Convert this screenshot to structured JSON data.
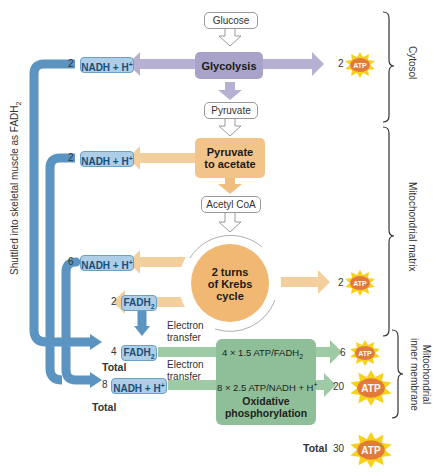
{
  "diagram": {
    "molecules": {
      "glucose": "Glucose",
      "pyruvate": "Pyruvate",
      "acetyl_coa": "Acetyl CoA"
    },
    "processes": {
      "glycolysis": "Glycolysis",
      "pyruvate_to_acetate_1": "Pyruvate",
      "pyruvate_to_acetate_2": "to acetate",
      "krebs_1": "2 turns",
      "krebs_2": "of Krebs",
      "krebs_3": "cycle",
      "oxphos_1": "Oxidative",
      "oxphos_2": "phosphorylation",
      "oxphos_line1": "4 × 1.5 ATP/FADH",
      "oxphos_line1_sub": "2",
      "oxphos_line2": "8 × 2.5 ATP/NADH + H",
      "oxphos_line2_sup": "+"
    },
    "carriers": [
      {
        "count": "2",
        "label": "NADH + H",
        "sup": "+",
        "source": "glycolysis"
      },
      {
        "count": "2",
        "label": "NADH + H",
        "sup": "+",
        "source": "pyruvate to acetate"
      },
      {
        "count": "6",
        "label": "NADH + H",
        "sup": "+",
        "source": "krebs"
      },
      {
        "count": "2",
        "label": "FADH",
        "sub": "2",
        "source": "krebs"
      },
      {
        "count": "4",
        "label": "FADH",
        "sub": "2",
        "source": "total"
      },
      {
        "count": "8",
        "label": "NADH + H",
        "sup": "+",
        "source": "total"
      }
    ],
    "atp_yields": [
      {
        "count": "2",
        "label": "ATP",
        "source": "glycolysis"
      },
      {
        "count": "2",
        "label": "ATP",
        "source": "krebs"
      },
      {
        "count": "6",
        "label": "ATP",
        "source": "FADH2 oxidation"
      },
      {
        "count": "20",
        "label": "ATP",
        "source": "NADH oxidation"
      },
      {
        "count": "30",
        "label": "ATP",
        "source": "total"
      }
    ],
    "labels": {
      "total": "Total",
      "electron": "Electron",
      "transfer": "transfer",
      "shuttle": "Shuttled into skeletal muscle as FADH",
      "shuttle_sub": "2"
    },
    "regions": {
      "cytosol": "Cytosol",
      "matrix": "Mitochondrial matrix",
      "membrane_1": "Mitochondrial",
      "membrane_2": "inner membrane"
    },
    "colors": {
      "glycolysis": "#a9a2c9",
      "pyruvate": "#f2c48a",
      "krebs": "#f0b872",
      "oxphos": "#8fbf98",
      "carrier_arrow": "#5b94c0",
      "carrier_fill": "#aecde6",
      "atp_burst": "#f7d21c",
      "atp_core": "#e27b3a"
    }
  }
}
